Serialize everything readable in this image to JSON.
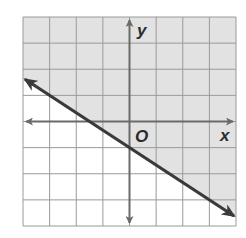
{
  "chart_data": {
    "type": "line",
    "title": "",
    "xlabel": "x",
    "ylabel": "y",
    "origin_label": "O",
    "xlim": [
      -4,
      4
    ],
    "ylim": [
      -4,
      4
    ],
    "grid": true,
    "grid_step": 1,
    "series": [
      {
        "name": "boundary",
        "style": "solid",
        "slope": -0.6667,
        "intercept": -1,
        "x": [
          -4,
          4
        ],
        "y": [
          1.67,
          -3.67
        ],
        "arrows": "both"
      }
    ],
    "shading": {
      "region": "above",
      "color": "#e2e2e2"
    }
  },
  "labels": {
    "x_axis": "x",
    "y_axis": "y",
    "origin": "O"
  },
  "colors": {
    "shade": "#e2e2e2",
    "grid": "#9a9a9a",
    "axis": "#6a6a6a",
    "line": "#3a3a3a"
  }
}
